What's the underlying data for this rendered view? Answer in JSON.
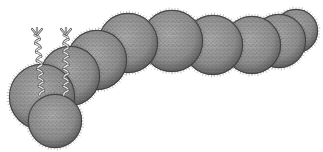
{
  "image": {
    "alt": "Stippled pen-and-ink illustration of a chain of spherical hairy cells with two braided forked flagella",
    "width": 323,
    "height": 152,
    "background": "#ffffff",
    "colors": {
      "cell_fill": "#8c8c8c",
      "cell_light": "#a6a6a6",
      "cell_edge": "#3a3a3a",
      "flagellum_light": "#e8e8e8",
      "flagellum_dark": "#555555"
    }
  },
  "cells": [
    {
      "id": "cell-10",
      "cx": 296,
      "cy": 31,
      "r": 22
    },
    {
      "id": "cell-9",
      "cx": 279,
      "cy": 41,
      "r": 27
    },
    {
      "id": "cell-8",
      "cx": 252,
      "cy": 45,
      "r": 29
    },
    {
      "id": "cell-7",
      "cx": 213,
      "cy": 45,
      "r": 30
    },
    {
      "id": "cell-6",
      "cx": 172,
      "cy": 41,
      "r": 31
    },
    {
      "id": "cell-5",
      "cx": 128,
      "cy": 43,
      "r": 30
    },
    {
      "id": "cell-4",
      "cx": 97,
      "cy": 60,
      "r": 30
    },
    {
      "id": "cell-3",
      "cx": 70,
      "cy": 76,
      "r": 30
    },
    {
      "id": "cell-2",
      "cx": 42,
      "cy": 97,
      "r": 33
    },
    {
      "id": "cell-1",
      "cx": 55,
      "cy": 121,
      "r": 27
    }
  ],
  "flagella": [
    {
      "id": "flagellum-left",
      "x_top": 37,
      "y_top": 29,
      "x_bottom": 42,
      "y_bottom": 95
    },
    {
      "id": "flagellum-right",
      "x_top": 66,
      "y_top": 29,
      "x_bottom": 66,
      "y_bottom": 95
    }
  ]
}
